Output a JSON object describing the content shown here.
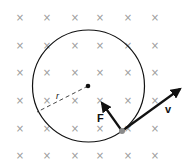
{
  "diagram": {
    "field_symbol": "×",
    "field_grid": {
      "columns_x": [
        20,
        47,
        75,
        100,
        128,
        155
      ],
      "rows_y": [
        17,
        45,
        72,
        100,
        128,
        155
      ]
    },
    "circle": {
      "cx": 88.5,
      "cy": 86,
      "r": 56
    },
    "radius_label": "r",
    "force_label": "F",
    "velocity_label": "v",
    "colors": {
      "line": "#111111",
      "field_marks": "#9a9a9a",
      "particle": "#8a8a8a"
    }
  }
}
